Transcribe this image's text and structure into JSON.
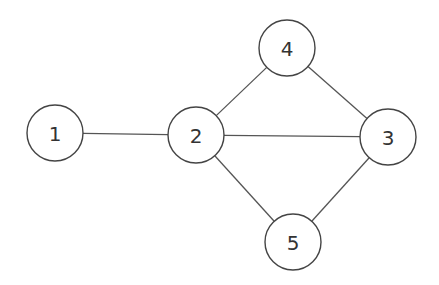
{
  "graph": {
    "nodes": [
      {
        "id": "1",
        "label": "1",
        "x": 55,
        "y": 133,
        "r": 28
      },
      {
        "id": "2",
        "label": "2",
        "x": 196,
        "y": 135,
        "r": 28
      },
      {
        "id": "3",
        "label": "3",
        "x": 388,
        "y": 137,
        "r": 28
      },
      {
        "id": "4",
        "label": "4",
        "x": 287,
        "y": 48,
        "r": 28
      },
      {
        "id": "5",
        "label": "5",
        "x": 293,
        "y": 242,
        "r": 28
      }
    ],
    "edges": [
      {
        "from": "1",
        "to": "2"
      },
      {
        "from": "2",
        "to": "3"
      },
      {
        "from": "2",
        "to": "4"
      },
      {
        "from": "2",
        "to": "5"
      },
      {
        "from": "4",
        "to": "3"
      },
      {
        "from": "5",
        "to": "3"
      }
    ],
    "directed": false
  },
  "colors": {
    "background": "#ffffff",
    "stroke": "#444444",
    "text": "#333333"
  }
}
